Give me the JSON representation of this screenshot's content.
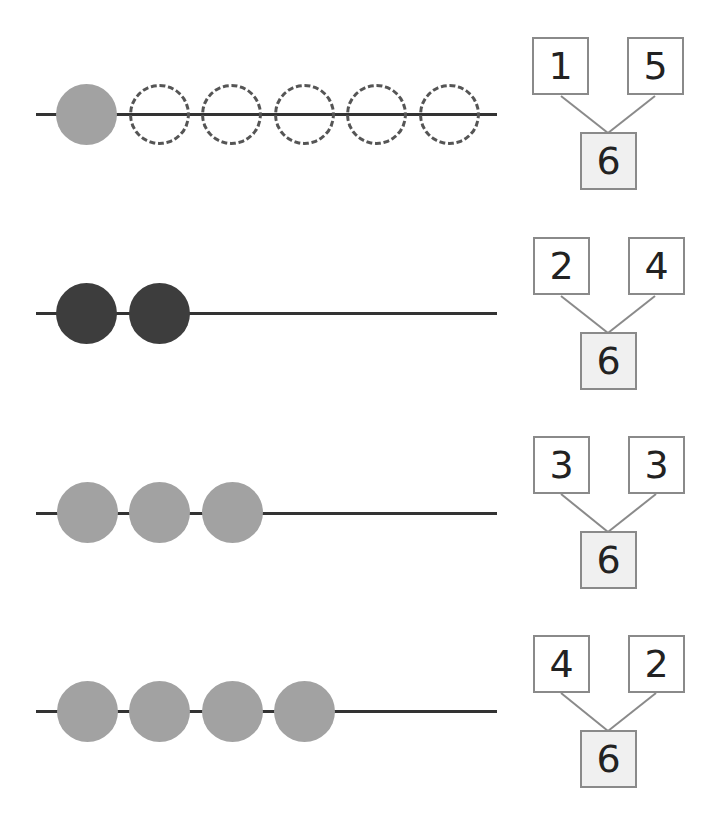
{
  "colors": {
    "rod": "#333333",
    "bead_gray": "#a2a2a2",
    "bead_dark": "#3d3d3d",
    "empty_outline": "#555555",
    "box_border": "#8a8a8a",
    "whole_box_fill": "#f0f0f0"
  },
  "rows": [
    {
      "beads": [
        "gray",
        "empty",
        "empty",
        "empty",
        "empty",
        "empty"
      ],
      "bond": {
        "left": "1",
        "right": "5",
        "whole": "6"
      }
    },
    {
      "beads": [
        "dark",
        "dark"
      ],
      "bond": {
        "left": "2",
        "right": "4",
        "whole": "6"
      }
    },
    {
      "beads": [
        "gray",
        "gray",
        "gray"
      ],
      "bond": {
        "left": "3",
        "right": "3",
        "whole": "6"
      }
    },
    {
      "beads": [
        "gray",
        "gray",
        "gray",
        "gray"
      ],
      "bond": {
        "left": "4",
        "right": "2",
        "whole": "6"
      }
    }
  ]
}
